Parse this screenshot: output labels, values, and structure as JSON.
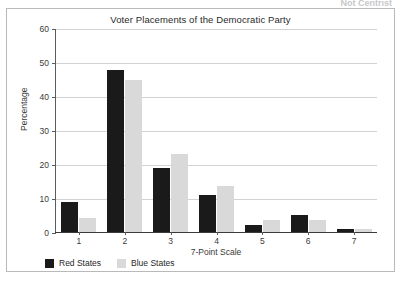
{
  "scan": {
    "top_cut_text": "Not Centrist"
  },
  "chart_data": {
    "type": "bar",
    "title": "Voter Placements of the Democratic Party",
    "xlabel": "7-Point Scale",
    "ylabel": "Percentage",
    "ylim": [
      0,
      60
    ],
    "yticks": [
      0,
      10,
      20,
      30,
      40,
      50,
      60
    ],
    "categories": [
      "1",
      "2",
      "3",
      "4",
      "5",
      "6",
      "7"
    ],
    "grid": true,
    "legend_position": "below-axis-left",
    "series": [
      {
        "name": "Red States",
        "color": "#1a1a1a",
        "values": [
          9,
          48,
          19,
          11,
          2,
          5,
          1
        ]
      },
      {
        "name": "Blue States",
        "color": "#d9d9d9",
        "values": [
          4,
          45,
          23,
          13.5,
          3.5,
          3.5,
          0.8
        ]
      }
    ]
  }
}
